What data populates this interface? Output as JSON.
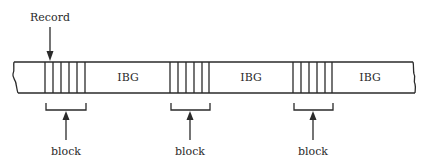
{
  "diagram": {
    "type": "magnetic tape blocking diagram",
    "record_label": "Record",
    "gap_label": "IBG",
    "block_label": "block",
    "colors": {
      "line": "#2a2a2a",
      "background": "#ffffff"
    },
    "blocks": [
      {
        "id": 1,
        "records_per_block": 5,
        "label": "block"
      },
      {
        "id": 2,
        "records_per_block": 5,
        "label": "block"
      },
      {
        "id": 3,
        "records_per_block": 5,
        "label": "block"
      }
    ],
    "gaps": [
      {
        "id": 1,
        "label": "IBG"
      },
      {
        "id": 2,
        "label": "IBG"
      },
      {
        "id": 3,
        "label": "IBG"
      }
    ]
  }
}
